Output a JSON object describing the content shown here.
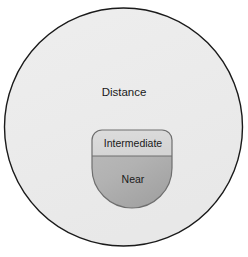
{
  "diagram": {
    "background_color": "#ffffff",
    "zones": [
      {
        "id": "distance",
        "label": "Distance",
        "fill_color": "#ececec",
        "stroke_color": "#1a1a1a",
        "label_x": 124,
        "label_y": 93
      },
      {
        "id": "intermediate",
        "label": "Intermediate",
        "fill_color": "#d9d9d9",
        "stroke_color": "#6e6e6e",
        "label_x": 133,
        "label_y": 145
      },
      {
        "id": "near",
        "label": "Near",
        "fill_color": "#b2b2b2",
        "stroke_color": "#6e6e6e",
        "label_x": 133,
        "label_y": 180
      }
    ],
    "geometry": {
      "outer_circle": {
        "cx": 123.5,
        "cy": 127,
        "r": 119.5
      },
      "inner_shape": {
        "cx": 132,
        "cy": 168,
        "r": 40,
        "flat_top_y": 130,
        "corner_radius": 10
      },
      "divider_line": {
        "x1": 92,
        "y1": 156,
        "x2": 172,
        "y2": 156
      }
    }
  }
}
